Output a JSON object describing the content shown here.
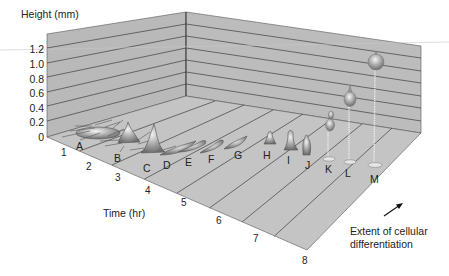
{
  "figure": {
    "y_axis": {
      "title": "Height (mm)",
      "ticks": [
        "1.2",
        "1.0",
        "0.8",
        "0.6",
        "0.4",
        "0.2",
        "0"
      ]
    },
    "x_axis": {
      "title": "Time (hr)",
      "ticks": [
        "1",
        "2",
        "3",
        "4",
        "5",
        "6",
        "7",
        "8"
      ]
    },
    "stages": [
      "A",
      "B",
      "C",
      "D",
      "E",
      "F",
      "G",
      "H",
      "I",
      "J",
      "K",
      "L",
      "M"
    ],
    "annotation": {
      "line1": "Extent of cellular",
      "line2": "differentiation"
    },
    "colors": {
      "wall": "#b9b9b9",
      "floor": "#c2c2c2",
      "grid_line": "#444444",
      "text": "#222222",
      "cell": "#9a9a9a"
    }
  }
}
